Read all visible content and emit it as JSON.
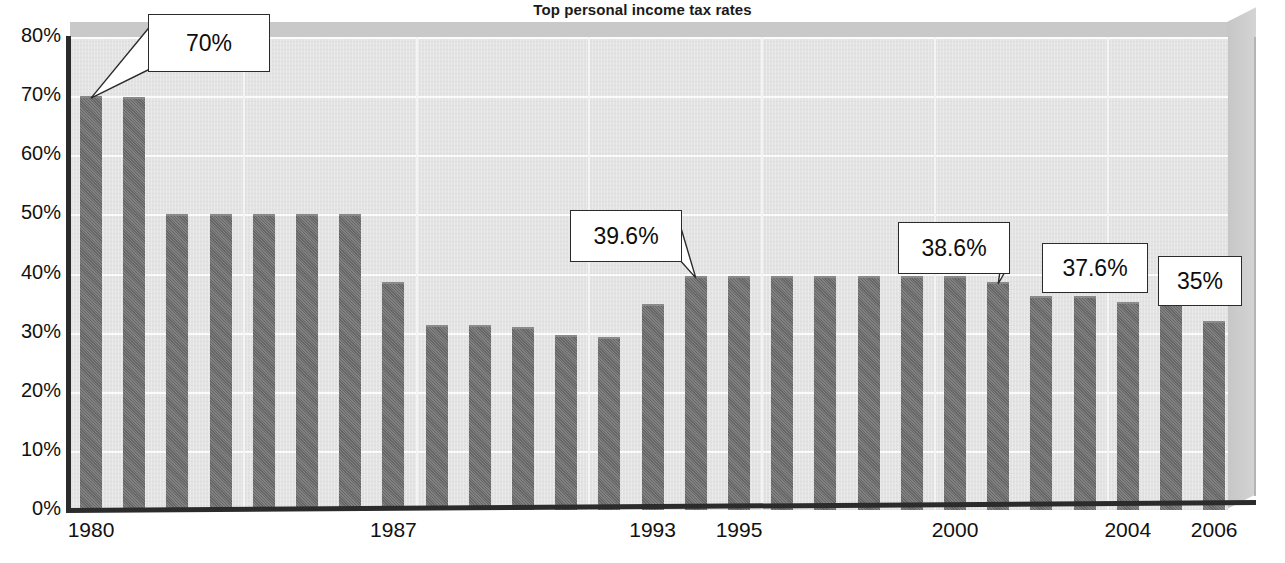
{
  "chart_data": {
    "type": "bar",
    "title": "Top personal income tax rates",
    "xlabel": "",
    "ylabel": "",
    "ylim": [
      0,
      80
    ],
    "ytick_labels": [
      "0%",
      "10%",
      "20%",
      "30%",
      "40%",
      "50%",
      "60%",
      "70%",
      "80%"
    ],
    "ytick_values": [
      0,
      10,
      20,
      30,
      40,
      50,
      60,
      70,
      80
    ],
    "grid": true,
    "legend": "none",
    "xtick_labels": [
      "1980",
      "1987",
      "1993",
      "1995",
      "2000",
      "2004",
      "2006"
    ],
    "xtick_years": [
      1980,
      1987,
      1993,
      1995,
      2000,
      2004,
      2006
    ],
    "categories": [
      "1980",
      "1981",
      "1982",
      "1983",
      "1984",
      "1985",
      "1986",
      "1987",
      "1988",
      "1989",
      "1990",
      "1991",
      "1992",
      "1993",
      "1994",
      "1995",
      "1996",
      "1997",
      "1998",
      "1999",
      "2000",
      "2001",
      "2002",
      "2003",
      "2004",
      "2005",
      "2006"
    ],
    "values": [
      70,
      69.8,
      50,
      50,
      50,
      50,
      50,
      38.5,
      31.3,
      31.3,
      31,
      29.6,
      29.3,
      34.8,
      39.6,
      39.6,
      39.6,
      39.6,
      39.6,
      39.6,
      39.6,
      38.6,
      36.2,
      36.2,
      35.2,
      35,
      32
    ],
    "annotations": [
      {
        "label": "70%",
        "value": 70,
        "category": "1980"
      },
      {
        "label": "39.6%",
        "value": 39.6,
        "category": "1994"
      },
      {
        "label": "38.6%",
        "value": 38.6,
        "category": "2001"
      },
      {
        "label": "37.6%",
        "value": 37.6,
        "category": "2004"
      },
      {
        "label": "35%",
        "value": 35,
        "category": "2005"
      }
    ],
    "colors": {
      "bar": "#6e6e6e",
      "plot_background": "#e3e3e3",
      "wall": "#c9c9c9",
      "gridline": "#fbfbfb",
      "axis": "#2b2b2b",
      "text": "#111111",
      "callout_background": "#ffffff",
      "callout_border": "#2b2b2b"
    }
  }
}
